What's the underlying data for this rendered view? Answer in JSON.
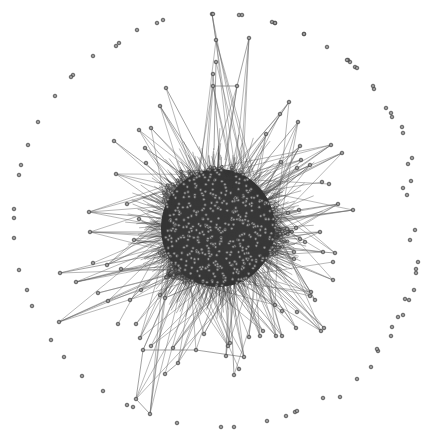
{
  "diagram": {
    "type": "network-graph",
    "layout": "force-directed",
    "width": 440,
    "height": 441,
    "background": "#ffffff",
    "colors": {
      "edge": "#3a3a3a",
      "edge_light": "#6a6a6a",
      "node_fill": "#9a9a9a",
      "node_stroke": "#3c3c3c",
      "core_fill": "#333333"
    },
    "core": {
      "center": [
        218,
        228
      ],
      "radius_x": 62,
      "radius_y": 62,
      "inner_nodes": 520,
      "inner_edges": 2600,
      "seed": 7
    },
    "spoke_nodes": [
      [
        212,
        14
      ],
      [
        216,
        40
      ],
      [
        249,
        38
      ],
      [
        237,
        86
      ],
      [
        213,
        86
      ],
      [
        216,
        62
      ],
      [
        213,
        74
      ],
      [
        289,
        102
      ],
      [
        280,
        114
      ],
      [
        298,
        122
      ],
      [
        266,
        134
      ],
      [
        300,
        146
      ],
      [
        331,
        145
      ],
      [
        342,
        153
      ],
      [
        301,
        160
      ],
      [
        281,
        162
      ],
      [
        310,
        165
      ],
      [
        297,
        168
      ],
      [
        322,
        182
      ],
      [
        329,
        184
      ],
      [
        338,
        204
      ],
      [
        353,
        210
      ],
      [
        299,
        210
      ],
      [
        166,
        88
      ],
      [
        160,
        106
      ],
      [
        139,
        130
      ],
      [
        151,
        128
      ],
      [
        114,
        141
      ],
      [
        145,
        148
      ],
      [
        116,
        174
      ],
      [
        146,
        163
      ],
      [
        89,
        212
      ],
      [
        127,
        204
      ],
      [
        90,
        232
      ],
      [
        139,
        219
      ],
      [
        134,
        240
      ],
      [
        60,
        273
      ],
      [
        76,
        282
      ],
      [
        93,
        263
      ],
      [
        107,
        265
      ],
      [
        121,
        269
      ],
      [
        98,
        293
      ],
      [
        141,
        290
      ],
      [
        165,
        298
      ],
      [
        130,
        300
      ],
      [
        160,
        295
      ],
      [
        59,
        322
      ],
      [
        108,
        301
      ],
      [
        118,
        324
      ],
      [
        136,
        324
      ],
      [
        140,
        338
      ],
      [
        151,
        346
      ],
      [
        143,
        350
      ],
      [
        165,
        374
      ],
      [
        178,
        363
      ],
      [
        136,
        399
      ],
      [
        150,
        414
      ],
      [
        173,
        348
      ],
      [
        196,
        350
      ],
      [
        204,
        334
      ],
      [
        228,
        346
      ],
      [
        230,
        343
      ],
      [
        244,
        357
      ],
      [
        239,
        369
      ],
      [
        234,
        375
      ],
      [
        249,
        337
      ],
      [
        260,
        336
      ],
      [
        276,
        336
      ],
      [
        226,
        356
      ],
      [
        282,
        336
      ],
      [
        310,
        296
      ],
      [
        296,
        328
      ],
      [
        321,
        331
      ],
      [
        324,
        328
      ],
      [
        297,
        312
      ],
      [
        333,
        280
      ],
      [
        315,
        300
      ],
      [
        323,
        252
      ],
      [
        335,
        253
      ],
      [
        333,
        262
      ],
      [
        294,
        259
      ],
      [
        294,
        252
      ],
      [
        311,
        292
      ],
      [
        275,
        305
      ],
      [
        282,
        311
      ],
      [
        305,
        242
      ],
      [
        320,
        232
      ],
      [
        300,
        239
      ],
      [
        287,
        229
      ],
      [
        296,
        228
      ],
      [
        288,
        213
      ],
      [
        263,
        331
      ]
    ],
    "peripheral_nodes": [
      [
        213,
        14
      ],
      [
        239,
        15
      ],
      [
        272,
        22
      ],
      [
        275,
        23
      ],
      [
        163,
        20
      ],
      [
        157,
        23
      ],
      [
        137,
        30
      ],
      [
        119,
        43
      ],
      [
        116,
        46
      ],
      [
        93,
        56
      ],
      [
        73,
        75
      ],
      [
        71,
        77
      ],
      [
        55,
        96
      ],
      [
        38,
        122
      ],
      [
        28,
        145
      ],
      [
        21,
        165
      ],
      [
        19,
        175
      ],
      [
        14,
        209
      ],
      [
        14,
        218
      ],
      [
        14,
        238
      ],
      [
        19,
        270
      ],
      [
        27,
        290
      ],
      [
        32,
        306
      ],
      [
        51,
        340
      ],
      [
        64,
        357
      ],
      [
        82,
        376
      ],
      [
        103,
        391
      ],
      [
        127,
        405
      ],
      [
        133,
        407
      ],
      [
        177,
        423
      ],
      [
        221,
        427
      ],
      [
        234,
        427
      ],
      [
        267,
        421
      ],
      [
        286,
        416
      ],
      [
        295,
        412
      ],
      [
        297,
        411
      ],
      [
        323,
        398
      ],
      [
        340,
        397
      ],
      [
        357,
        379
      ],
      [
        371,
        367
      ],
      [
        378,
        351
      ],
      [
        377,
        349
      ],
      [
        391,
        336
      ],
      [
        392,
        327
      ],
      [
        398,
        317
      ],
      [
        403,
        315
      ],
      [
        405,
        299
      ],
      [
        409,
        300
      ],
      [
        414,
        290
      ],
      [
        416,
        273
      ],
      [
        416,
        269
      ],
      [
        418,
        262
      ],
      [
        410,
        240
      ],
      [
        415,
        230
      ],
      [
        407,
        195
      ],
      [
        403,
        188
      ],
      [
        411,
        181
      ],
      [
        408,
        164
      ],
      [
        412,
        158
      ],
      [
        403,
        133
      ],
      [
        402,
        127
      ],
      [
        392,
        117
      ],
      [
        391,
        113
      ],
      [
        386,
        108
      ],
      [
        374,
        89
      ],
      [
        373,
        86
      ],
      [
        355,
        67
      ],
      [
        350,
        62
      ],
      [
        348,
        60
      ],
      [
        327,
        47
      ],
      [
        304,
        34
      ],
      [
        275,
        23
      ],
      [
        357,
        68
      ],
      [
        347,
        60
      ],
      [
        304,
        34
      ],
      [
        242,
        15
      ]
    ],
    "long_edges": [
      [
        [
          212,
          14
        ],
        [
          216,
          40
        ]
      ],
      [
        [
          249,
          38
        ],
        [
          237,
          86
        ]
      ],
      [
        [
          237,
          86
        ],
        [
          213,
          86
        ]
      ],
      [
        [
          237,
          86
        ],
        [
          225,
          160
        ]
      ],
      [
        [
          216,
          62
        ],
        [
          214,
          150
        ]
      ],
      [
        [
          213,
          74
        ],
        [
          220,
          160
        ]
      ],
      [
        [
          136,
          399
        ],
        [
          150,
          414
        ]
      ],
      [
        [
          143,
          350
        ],
        [
          136,
          399
        ]
      ],
      [
        [
          143,
          350
        ],
        [
          196,
          350
        ]
      ],
      [
        [
          196,
          350
        ],
        [
          244,
          357
        ]
      ],
      [
        [
          165,
          374
        ],
        [
          178,
          363
        ]
      ],
      [
        [
          234,
          375
        ],
        [
          230,
          290
        ]
      ],
      [
        [
          89,
          212
        ],
        [
          160,
          218
        ]
      ],
      [
        [
          90,
          232
        ],
        [
          165,
          232
        ]
      ],
      [
        [
          59,
          322
        ],
        [
          150,
          282
        ]
      ],
      [
        [
          60,
          273
        ],
        [
          155,
          255
        ]
      ],
      [
        [
          76,
          282
        ],
        [
          160,
          262
        ]
      ],
      [
        [
          353,
          210
        ],
        [
          280,
          220
        ]
      ],
      [
        [
          338,
          204
        ],
        [
          272,
          214
        ]
      ],
      [
        [
          342,
          153
        ],
        [
          270,
          190
        ]
      ],
      [
        [
          331,
          145
        ],
        [
          268,
          188
        ]
      ],
      [
        [
          289,
          102
        ],
        [
          240,
          175
        ]
      ],
      [
        [
          166,
          88
        ],
        [
          210,
          170
        ]
      ],
      [
        [
          160,
          106
        ],
        [
          205,
          175
        ]
      ],
      [
        [
          114,
          141
        ],
        [
          180,
          190
        ]
      ],
      [
        [
          333,
          280
        ],
        [
          270,
          255
        ]
      ],
      [
        [
          323,
          252
        ],
        [
          268,
          245
        ]
      ],
      [
        [
          335,
          253
        ],
        [
          270,
          248
        ]
      ],
      [
        [
          310,
          296
        ],
        [
          262,
          262
        ]
      ],
      [
        [
          321,
          331
        ],
        [
          258,
          270
        ]
      ],
      [
        [
          324,
          328
        ],
        [
          262,
          268
        ]
      ],
      [
        [
          263,
          331
        ],
        [
          232,
          290
        ]
      ],
      [
        [
          276,
          336
        ],
        [
          238,
          290
        ]
      ],
      [
        [
          282,
          336
        ],
        [
          242,
          288
        ]
      ],
      [
        [
          300,
          146
        ],
        [
          257,
          190
        ]
      ],
      [
        [
          298,
          122
        ],
        [
          250,
          180
        ]
      ]
    ]
  }
}
